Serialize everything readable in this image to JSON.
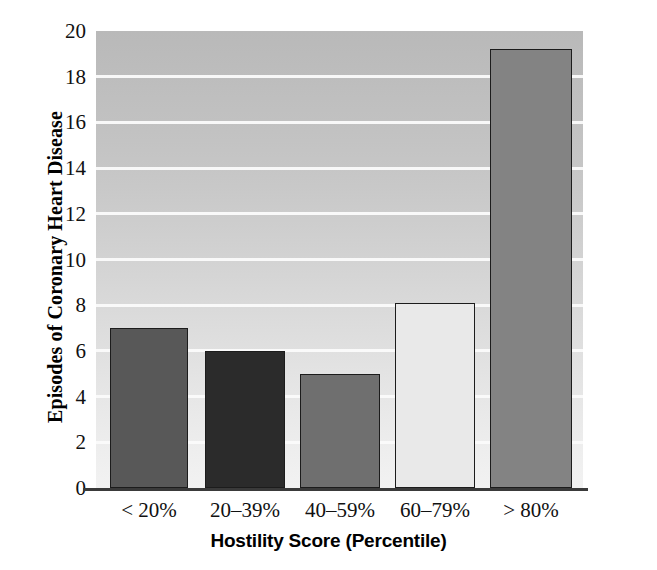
{
  "chart_data": {
    "type": "bar",
    "title": "",
    "xlabel": "Hostility Score (Percentile)",
    "ylabel": "Episodes of Coronary Heart Disease",
    "categories": [
      "< 20%",
      "20–39%",
      "40–59%",
      "60–79%",
      "> 80%"
    ],
    "values": [
      7.0,
      6.0,
      5.0,
      8.1,
      19.2
    ],
    "ylim": [
      0,
      20
    ],
    "ytick_labels": [
      "0",
      "2",
      "4",
      "6",
      "8",
      "10",
      "12",
      "14",
      "16",
      "18",
      "20"
    ],
    "ytick_values": [
      0,
      2,
      4,
      6,
      8,
      10,
      12,
      14,
      16,
      18,
      20
    ],
    "grid": "horizontal-white",
    "legend": "none",
    "bar_colors": [
      "#585858",
      "#2b2b2b",
      "#6f6f6f",
      "#e9e9e9",
      "#838383"
    ],
    "bar_edge_color": "#1c1c1c",
    "plot_background": "#cfcfcf",
    "axis_color": "#3a3a3a"
  }
}
